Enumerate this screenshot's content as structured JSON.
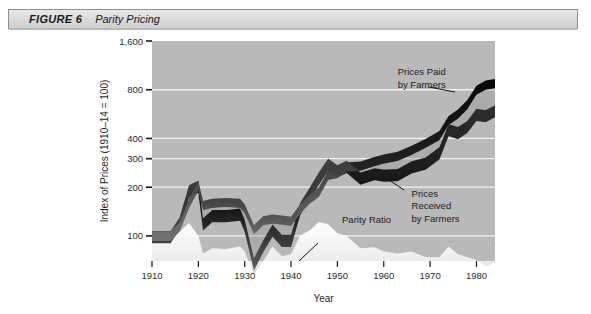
{
  "figure": {
    "number_label": "FIGURE 6",
    "title": "Parity Pricing"
  },
  "chart_data": {
    "type": "area",
    "title": "Parity Pricing",
    "xlabel": "Year",
    "ylabel": "Index of Prices (1910–14 = 100)",
    "x_ticks": [
      "1910",
      "1920",
      "1930",
      "1940",
      "1950",
      "1960",
      "1970",
      "1980"
    ],
    "x_tick_values": [
      1910,
      1920,
      1930,
      1940,
      1950,
      1960,
      1970,
      1980
    ],
    "xlim": [
      1910,
      1984
    ],
    "y_ticks": [
      "100",
      "200",
      "300",
      "400",
      "800",
      "1,600"
    ],
    "y_tick_values": [
      100,
      200,
      300,
      400,
      800,
      1600
    ],
    "ylim": [
      70,
      1600
    ],
    "y_scale": "log",
    "grid": "horizontal-white",
    "legend": "none",
    "plot_background": "#b9b9b9",
    "band_color": "#111111",
    "parity_color": "#f4f4f4",
    "annotations": [
      {
        "name": "prices-paid",
        "text": "Prices Paid\nby Farmers",
        "lines": [
          "Prices Paid",
          "by Farmers"
        ],
        "x": 1963,
        "y": 980
      },
      {
        "name": "prices-received",
        "text": "Prices Received by Farmers",
        "lines": [
          "Prices",
          "Received",
          "by Farmers"
        ],
        "x": 1966,
        "y": 175
      },
      {
        "name": "parity-ratio",
        "text": "Parity Ratio",
        "lines": [
          "Parity Ratio"
        ],
        "x": 1951,
        "y": 120
      }
    ],
    "series": [
      {
        "name": "Prices Paid by Farmers",
        "x": [
          1910,
          1914,
          1916,
          1918,
          1920,
          1921,
          1923,
          1926,
          1929,
          1930,
          1932,
          1934,
          1936,
          1938,
          1940,
          1942,
          1944,
          1946,
          1948,
          1950,
          1952,
          1955,
          1958,
          1960,
          1963,
          1966,
          1969,
          1972,
          1974,
          1976,
          1978,
          1980,
          1982,
          1984
        ],
        "values": [
          100,
          100,
          115,
          160,
          205,
          155,
          160,
          162,
          160,
          148,
          110,
          125,
          128,
          126,
          124,
          148,
          170,
          188,
          238,
          245,
          268,
          272,
          290,
          300,
          312,
          340,
          375,
          420,
          520,
          570,
          650,
          800,
          860,
          880
        ]
      },
      {
        "name": "Prices Received by Farmers",
        "x": [
          1910,
          1914,
          1916,
          1918,
          1920,
          1921,
          1923,
          1926,
          1929,
          1930,
          1932,
          1934,
          1936,
          1938,
          1940,
          1942,
          1944,
          1946,
          1948,
          1950,
          1952,
          1955,
          1958,
          1960,
          1963,
          1966,
          1969,
          1972,
          1974,
          1976,
          1978,
          1980,
          1982,
          1984
        ],
        "values": [
          100,
          100,
          122,
          192,
          205,
          120,
          135,
          135,
          138,
          118,
          68,
          88,
          110,
          95,
          95,
          150,
          185,
          230,
          280,
          255,
          272,
          230,
          245,
          240,
          242,
          270,
          285,
          330,
          460,
          440,
          480,
          570,
          560,
          600
        ]
      },
      {
        "name": "Parity Ratio",
        "x": [
          1910,
          1914,
          1916,
          1918,
          1920,
          1921,
          1923,
          1926,
          1929,
          1930,
          1932,
          1934,
          1936,
          1938,
          1940,
          1942,
          1944,
          1946,
          1948,
          1950,
          1952,
          1955,
          1958,
          1960,
          1963,
          1966,
          1969,
          1972,
          1974,
          1976,
          1978,
          1980,
          1982,
          1984
        ],
        "values": [
          100,
          100,
          106,
          120,
          100,
          78,
          84,
          83,
          86,
          80,
          58,
          70,
          86,
          75,
          77,
          101,
          108,
          122,
          118,
          104,
          100,
          84,
          85,
          80,
          78,
          80,
          74,
          74,
          86,
          77,
          74,
          71,
          65,
          68
        ]
      }
    ]
  }
}
